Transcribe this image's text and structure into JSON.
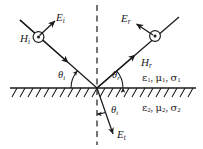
{
  "figure": {
    "width": 203,
    "height": 149,
    "background_color": "#ffffff",
    "line_color": "#1a1a1a",
    "text_color": "#1a1a1a"
  },
  "labels": {
    "incident_electric_field": {
      "base": "E",
      "sub": "i"
    },
    "incident_magnetic_field": {
      "base": "H",
      "sub": "i"
    },
    "reflected_electric_field": {
      "base": "E",
      "sub": "r"
    },
    "reflected_magnetic_field": {
      "base": "H",
      "sub": "r"
    },
    "transmitted_electric_field": {
      "base": "E",
      "sub": "t"
    },
    "angle_incidence": {
      "base": "θ",
      "sub": "i"
    },
    "angle_reflection": {
      "base": "θ",
      "sub": "r"
    },
    "angle_transmission": {
      "base": "θ",
      "sub": "t"
    },
    "medium_1": {
      "eps": "ε",
      "eps_sub": "1",
      "mu": "μ",
      "mu_sub": "1",
      "sigma": "σ",
      "sigma_sub": "1",
      "sep": ", "
    },
    "medium_2": {
      "eps": "ε",
      "eps_sub": "2",
      "mu": "μ",
      "mu_sub": "2",
      "sigma": "σ",
      "sigma_sub": "2",
      "sep": ", "
    }
  },
  "geometry": {
    "origin": {
      "x": 97,
      "y": 88
    },
    "interface_line": {
      "x1": 10,
      "y1": 88,
      "x2": 196,
      "y2": 88
    },
    "normal_dashed_line": {
      "x1": 97,
      "y1": 5,
      "x2": 97,
      "y2": 145,
      "dash": "5 4"
    },
    "incident_ray": {
      "x1": 22,
      "y1": 22,
      "x2": 97,
      "y2": 88,
      "arrow_at": 0.62
    },
    "reflected_ray": {
      "x1": 97,
      "y1": 88,
      "x2": 178,
      "y2": 18,
      "arrow_at": 0.42
    },
    "transmitted_ray": {
      "x1": 97,
      "y1": 88,
      "x2": 112,
      "y2": 132,
      "arrow_at": 0.9
    },
    "incident_H_marker": {
      "cx": 38,
      "cy": 37,
      "r_outer": 5.2,
      "r_dot": 1.5
    },
    "reflected_H_marker": {
      "cx": 155,
      "cy": 37,
      "r_outer": 5.2,
      "r_dot": 1.5
    },
    "incident_E_vector": {
      "x1": 38,
      "y1": 37,
      "x2": 55,
      "y2": 21
    },
    "reflected_E_vector": {
      "x1": 155,
      "y1": 37,
      "x2": 136,
      "y2": 23
    },
    "angle_arc_incidence": {
      "cx": 97,
      "cy": 88,
      "r": 26,
      "from_deg": 180,
      "to_deg": 221
    },
    "angle_arc_reflection": {
      "cx": 97,
      "cy": 88,
      "r": 26,
      "from_deg": 0,
      "to_deg": -41
    },
    "angle_arc_transmission": {
      "cx": 97,
      "cy": 88,
      "r": 26,
      "from_deg": 90,
      "to_deg": 71
    },
    "hatching": {
      "count": 22,
      "start_x": 12,
      "step": 8.2,
      "length": 9,
      "slant_dx": 5,
      "slant_dy": 9,
      "baseline_y": 88
    }
  }
}
